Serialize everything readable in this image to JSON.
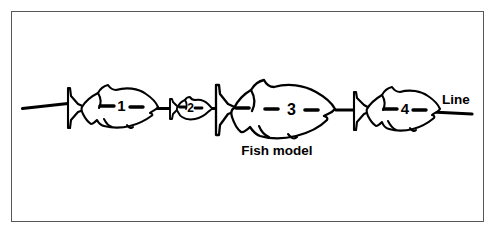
{
  "figure": {
    "type": "line-drawing-diagram",
    "background_color": "#ffffff",
    "frame_color": "#58585a",
    "ink_color": "#000000"
  },
  "labels": {
    "fish_model": "Fish model",
    "line": "Line"
  },
  "fish": [
    {
      "number": "1",
      "size_rank": "medium",
      "dashes": 2
    },
    {
      "number": "2",
      "size_rank": "smallest",
      "dashes": 2
    },
    {
      "number": "3",
      "size_rank": "largest",
      "dashes": 3
    },
    {
      "number": "4",
      "size_rank": "medium",
      "dashes": 2
    }
  ],
  "caption_partial": ""
}
